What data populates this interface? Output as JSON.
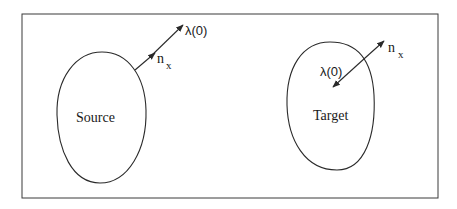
{
  "diagram": {
    "source": {
      "label": "Source",
      "lambda_label": "λ(0)",
      "normal_label": "n",
      "normal_subscript": "x"
    },
    "target": {
      "label": "Target",
      "lambda_label": "λ(0)",
      "normal_label": "n",
      "normal_subscript": "x"
    },
    "colors": {
      "stroke": "#2a2a2a",
      "background": "#ffffff"
    }
  }
}
